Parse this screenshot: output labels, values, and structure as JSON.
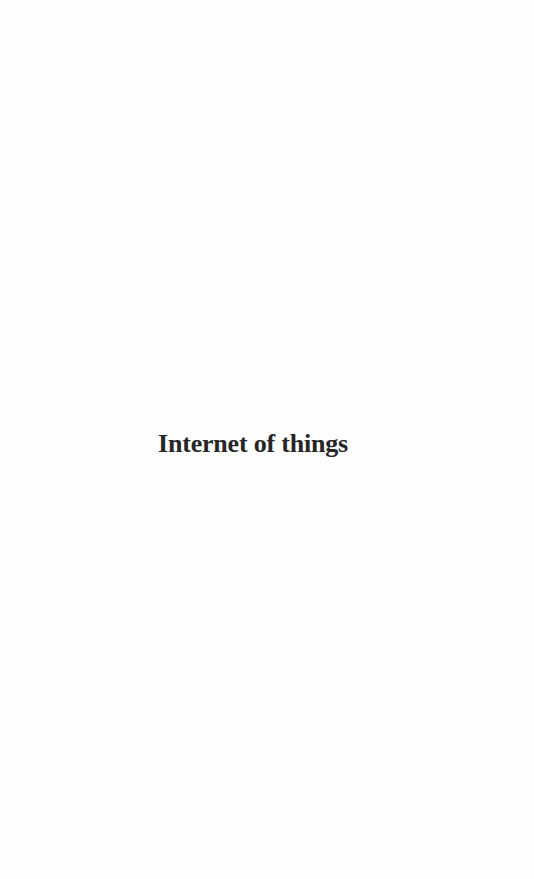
{
  "page": {
    "half_title": "Internet of things",
    "colors": {
      "background": "#fefefe",
      "text": "#262626"
    }
  }
}
